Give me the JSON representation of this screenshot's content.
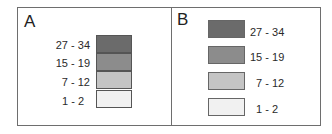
{
  "panels": [
    {
      "id": "A",
      "label": "A",
      "style": "stacked",
      "entries": [
        {
          "range": "27 - 34",
          "color": "#6b6b6b"
        },
        {
          "range": "15 - 19",
          "color": "#8c8c8c"
        },
        {
          "range": "7 - 12",
          "color": "#c4c4c4"
        },
        {
          "range": "1 - 2",
          "color": "#f1f1f1"
        }
      ]
    },
    {
      "id": "B",
      "label": "B",
      "style": "separated",
      "entries": [
        {
          "range": "27 - 34",
          "color": "#6b6b6b"
        },
        {
          "range": "15 - 19",
          "color": "#8c8c8c"
        },
        {
          "range": "7 - 12",
          "color": "#c4c4c4"
        },
        {
          "range": "1 - 2",
          "color": "#f1f1f1"
        }
      ]
    }
  ]
}
